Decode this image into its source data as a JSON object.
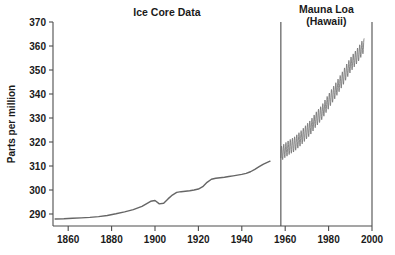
{
  "chart_data": {
    "type": "line",
    "title": "",
    "xlabel": "",
    "ylabel": "Parts per million",
    "xlim": [
      1853,
      2000
    ],
    "ylim": [
      285,
      370
    ],
    "xticks": [
      1860,
      1880,
      1900,
      1920,
      1940,
      1960,
      1980,
      2000
    ],
    "yticks": [
      290,
      300,
      310,
      320,
      330,
      340,
      350,
      360,
      370
    ],
    "grid": false,
    "legend_position": "none",
    "annotations": [
      {
        "text": "Ice Core Data",
        "x": 1905,
        "y": 370
      },
      {
        "text": "Mauna Loa",
        "x": 1979,
        "y": 372
      },
      {
        "text": "(Hawaii)",
        "x": 1979,
        "y": 365
      }
    ],
    "panel_divider_x": 1958,
    "series": [
      {
        "name": "Ice Core Data",
        "color": "#666666",
        "x": [
          1854,
          1858,
          1862,
          1866,
          1870,
          1874,
          1878,
          1882,
          1886,
          1890,
          1894,
          1898,
          1900,
          1902,
          1904,
          1906,
          1908,
          1910,
          1912,
          1914,
          1916,
          1918,
          1920,
          1922,
          1924,
          1926,
          1928,
          1930,
          1932,
          1934,
          1936,
          1938,
          1940,
          1942,
          1944,
          1946,
          1948,
          1950,
          1953
        ],
        "values": [
          287.9,
          288.0,
          288.2,
          288.4,
          288.6,
          288.9,
          289.4,
          290.1,
          290.9,
          291.8,
          293.2,
          295.3,
          295.6,
          294.2,
          294.5,
          296.3,
          297.9,
          299.0,
          299.3,
          299.5,
          299.7,
          300.0,
          300.4,
          301.4,
          303.2,
          304.5,
          304.9,
          305.1,
          305.3,
          305.6,
          305.9,
          306.2,
          306.5,
          306.9,
          307.6,
          308.6,
          309.7,
          310.8,
          312.0
        ]
      },
      {
        "name": "Mauna Loa (Hawaii)",
        "color": "#666666",
        "x_start": 1958,
        "x_end": 1996,
        "annual_mean_start": 315.0,
        "annual_mean_end": 361.0,
        "seasonal_amplitude": 3.0,
        "description": "Monthly mean CO2 with seasonal sawtooth oscillation rising from about 315 ppm in 1958 to about 362 ppm in 1996",
        "annual_means": [
          315.0,
          315.8,
          316.6,
          317.2,
          317.9,
          318.4,
          318.9,
          319.7,
          320.6,
          321.4,
          322.4,
          323.4,
          324.5,
          325.4,
          326.5,
          327.8,
          329.2,
          330.3,
          331.3,
          332.5,
          334.0,
          335.5,
          336.9,
          338.4,
          339.8,
          341.2,
          342.7,
          344.2,
          345.7,
          347.3,
          349.0,
          350.5,
          352.0,
          353.3,
          354.5,
          355.7,
          357.0,
          358.5,
          360.0
        ]
      }
    ]
  },
  "axes": {
    "y_axis_title": "Parts per million",
    "x_tick_labels": [
      "1860",
      "1880",
      "1900",
      "1920",
      "1940",
      "1960",
      "1980",
      "2000"
    ],
    "y_tick_labels": [
      "290",
      "300",
      "310",
      "320",
      "330",
      "340",
      "350",
      "360",
      "370"
    ]
  },
  "panels": {
    "left": {
      "title": "Ice Core Data"
    },
    "right": {
      "title_line1": "Mauna Loa",
      "title_line2": "(Hawaii)"
    }
  },
  "colors": {
    "line": "#666666",
    "axis": "#4d4d4d",
    "text": "#1a1a1a",
    "background": "#ffffff"
  }
}
